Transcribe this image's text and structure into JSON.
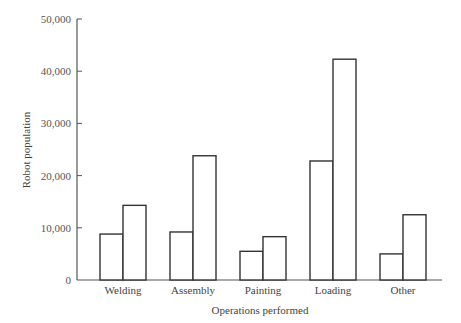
{
  "chart_data": {
    "type": "bar",
    "title": "",
    "xlabel": "Operations performed",
    "ylabel": "Robot population",
    "categories": [
      "Welding",
      "Assembly",
      "Painting",
      "Loading",
      "Other"
    ],
    "series": [
      {
        "name": "Series 1",
        "values": [
          8800,
          9200,
          5500,
          22800,
          5000
        ]
      },
      {
        "name": "Series 2",
        "values": [
          14300,
          23800,
          8300,
          42300,
          12500
        ]
      }
    ],
    "ylim": [
      0,
      50000
    ],
    "yticks": [
      0,
      10000,
      20000,
      30000,
      40000,
      50000
    ],
    "ytick_labels": [
      "0",
      "10,000",
      "20,000",
      "30,000",
      "40,000",
      "50,000"
    ],
    "grid": false,
    "legend": "none"
  }
}
